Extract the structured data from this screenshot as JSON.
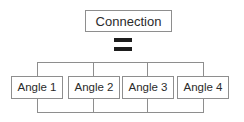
{
  "diagram": {
    "root": {
      "label": "Connection"
    },
    "operator": {
      "symbol": "=",
      "name": "equals-sign"
    },
    "leaves": [
      {
        "label": "Angle 1"
      },
      {
        "label": "Angle 2"
      },
      {
        "label": "Angle 3"
      },
      {
        "label": "Angle 4"
      }
    ],
    "colors": {
      "background": "#ffffff",
      "line": "#8e8e8e",
      "box_border": "#8e8e8e",
      "text": "#2b2b2b",
      "operator": "#1d1d1d"
    }
  }
}
